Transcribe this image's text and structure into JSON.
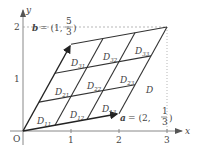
{
  "axes": {
    "x_label": "x",
    "y_label": "y",
    "origin_label": "O",
    "x_ticks": [
      "1",
      "2",
      "3"
    ],
    "y_ticks": [
      "1",
      "2"
    ]
  },
  "vectors": {
    "a": {
      "name": "a",
      "eq": "= (2,",
      "num": "1",
      "den": "3",
      "close": ")"
    },
    "b": {
      "name": "b",
      "eq": "= (1,",
      "num": "5",
      "den": "3",
      "close": ")"
    }
  },
  "region_label": "D",
  "cells": [
    {
      "main": "D",
      "sub": "11",
      "x": 0,
      "y": 0
    },
    {
      "main": "D",
      "sub": "12",
      "x": 1,
      "y": 0
    },
    {
      "main": "D",
      "sub": "13",
      "x": 2,
      "y": 0
    },
    {
      "main": "D",
      "sub": "21",
      "x": 0,
      "y": 1
    },
    {
      "main": "D",
      "sub": "22",
      "x": 1,
      "y": 1
    },
    {
      "main": "D",
      "sub": "23",
      "x": 2,
      "y": 1
    },
    {
      "main": "D",
      "sub": "31",
      "x": 0,
      "y": 2
    },
    {
      "main": "D",
      "sub": "32",
      "x": 1,
      "y": 2
    },
    {
      "main": "D",
      "sub": "33",
      "x": 2,
      "y": 2
    }
  ]
}
